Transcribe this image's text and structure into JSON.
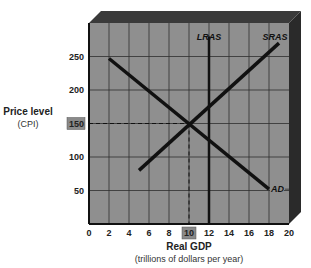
{
  "chart_data": {
    "type": "line",
    "title": "",
    "xlabel": "Real GDP",
    "xlabel_sub": "(trillions of dollars per year)",
    "ylabel": "Price level",
    "ylabel_sub": "(CPI)",
    "xlim": [
      0,
      20
    ],
    "ylim": [
      0,
      300
    ],
    "x_ticks": [
      "0",
      "2",
      "4",
      "6",
      "8",
      "10",
      "12",
      "14",
      "16",
      "18",
      "20"
    ],
    "y_ticks": [
      "50",
      "100",
      "150",
      "200",
      "250"
    ],
    "grid": true,
    "highlighted_x_tick": "10",
    "highlighted_y_tick": "150",
    "series": [
      {
        "name": "AD",
        "points": [
          [
            2,
            247
          ],
          [
            18,
            52
          ]
        ]
      },
      {
        "name": "SRAS",
        "points": [
          [
            5,
            80
          ],
          [
            19,
            270
          ]
        ]
      },
      {
        "name": "LRAS",
        "points": [
          [
            12,
            0
          ],
          [
            12,
            280
          ]
        ]
      }
    ],
    "equilibrium": {
      "x": 10,
      "y": 150
    },
    "colors": {
      "plot_bg": "#8f8f8f",
      "frame_dark": "#2a2a2a",
      "frame_top": "#3a3a3a",
      "grid": "#2e2e2e",
      "curve": "#111111",
      "tick_highlight": "#8a8a8a"
    }
  }
}
